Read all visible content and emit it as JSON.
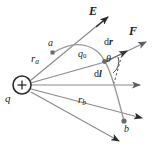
{
  "figure": {
    "type": "physics-vector-diagram",
    "width": 160,
    "height": 158,
    "background": "#ffffff",
    "line_color": "#7a7a7a",
    "dark_color": "#2b2b2b",
    "text_color": "#1a1a1a"
  },
  "labels": {
    "source_charge": "q",
    "test_charge": "q",
    "test_charge_sub": "0",
    "point_a": "a",
    "point_b": "b",
    "r_a": "r",
    "r_a_sub": "a",
    "r_b": "r",
    "r_b_sub": "b",
    "field_E": "E",
    "force_F": "F",
    "displacement_dr_d": "d",
    "displacement_dr_r": "r",
    "displacement_dl_d": "d",
    "displacement_dl_l": "l",
    "angle_theta": "θ",
    "charge_sign": "+"
  },
  "elements": {
    "source_charge_circle": {
      "cx": 22,
      "cy": 85,
      "r": 9
    },
    "point_a_marker": {
      "x": 53,
      "y": 53
    },
    "point_b_marker": {
      "x": 124,
      "y": 121
    },
    "dr_origin_marker": {
      "x": 104,
      "y": 62
    },
    "vector_E": {
      "from": [
        44,
        66
      ],
      "to": [
        108,
        17
      ]
    },
    "vector_F": {
      "from": [
        104,
        62
      ],
      "to": [
        151,
        40
      ]
    },
    "vector_dr": {
      "from": [
        104,
        62
      ],
      "to": [
        131,
        49
      ]
    },
    "vector_horizontal": {
      "from": [
        31,
        85
      ],
      "to": [
        145,
        85
      ]
    },
    "vector_ra_extended": {
      "from": [
        31,
        80
      ],
      "to": [
        108,
        17
      ]
    },
    "vector_rb_extended": {
      "from": [
        31,
        89
      ],
      "to": [
        147,
        119
      ]
    },
    "vector_rb_lower": {
      "from": [
        31,
        92
      ],
      "to": [
        124,
        144
      ]
    },
    "trajectory_curve": "starts at a (53,53), arcs up to apex near (92,48), curves down through (108,70) to b (124,121)",
    "angle_arc_theta": {
      "vertex": [
        104,
        62
      ],
      "radius": 13
    },
    "dashed_line": {
      "from": [
        122,
        52
      ],
      "to": [
        113,
        83
      ]
    }
  }
}
